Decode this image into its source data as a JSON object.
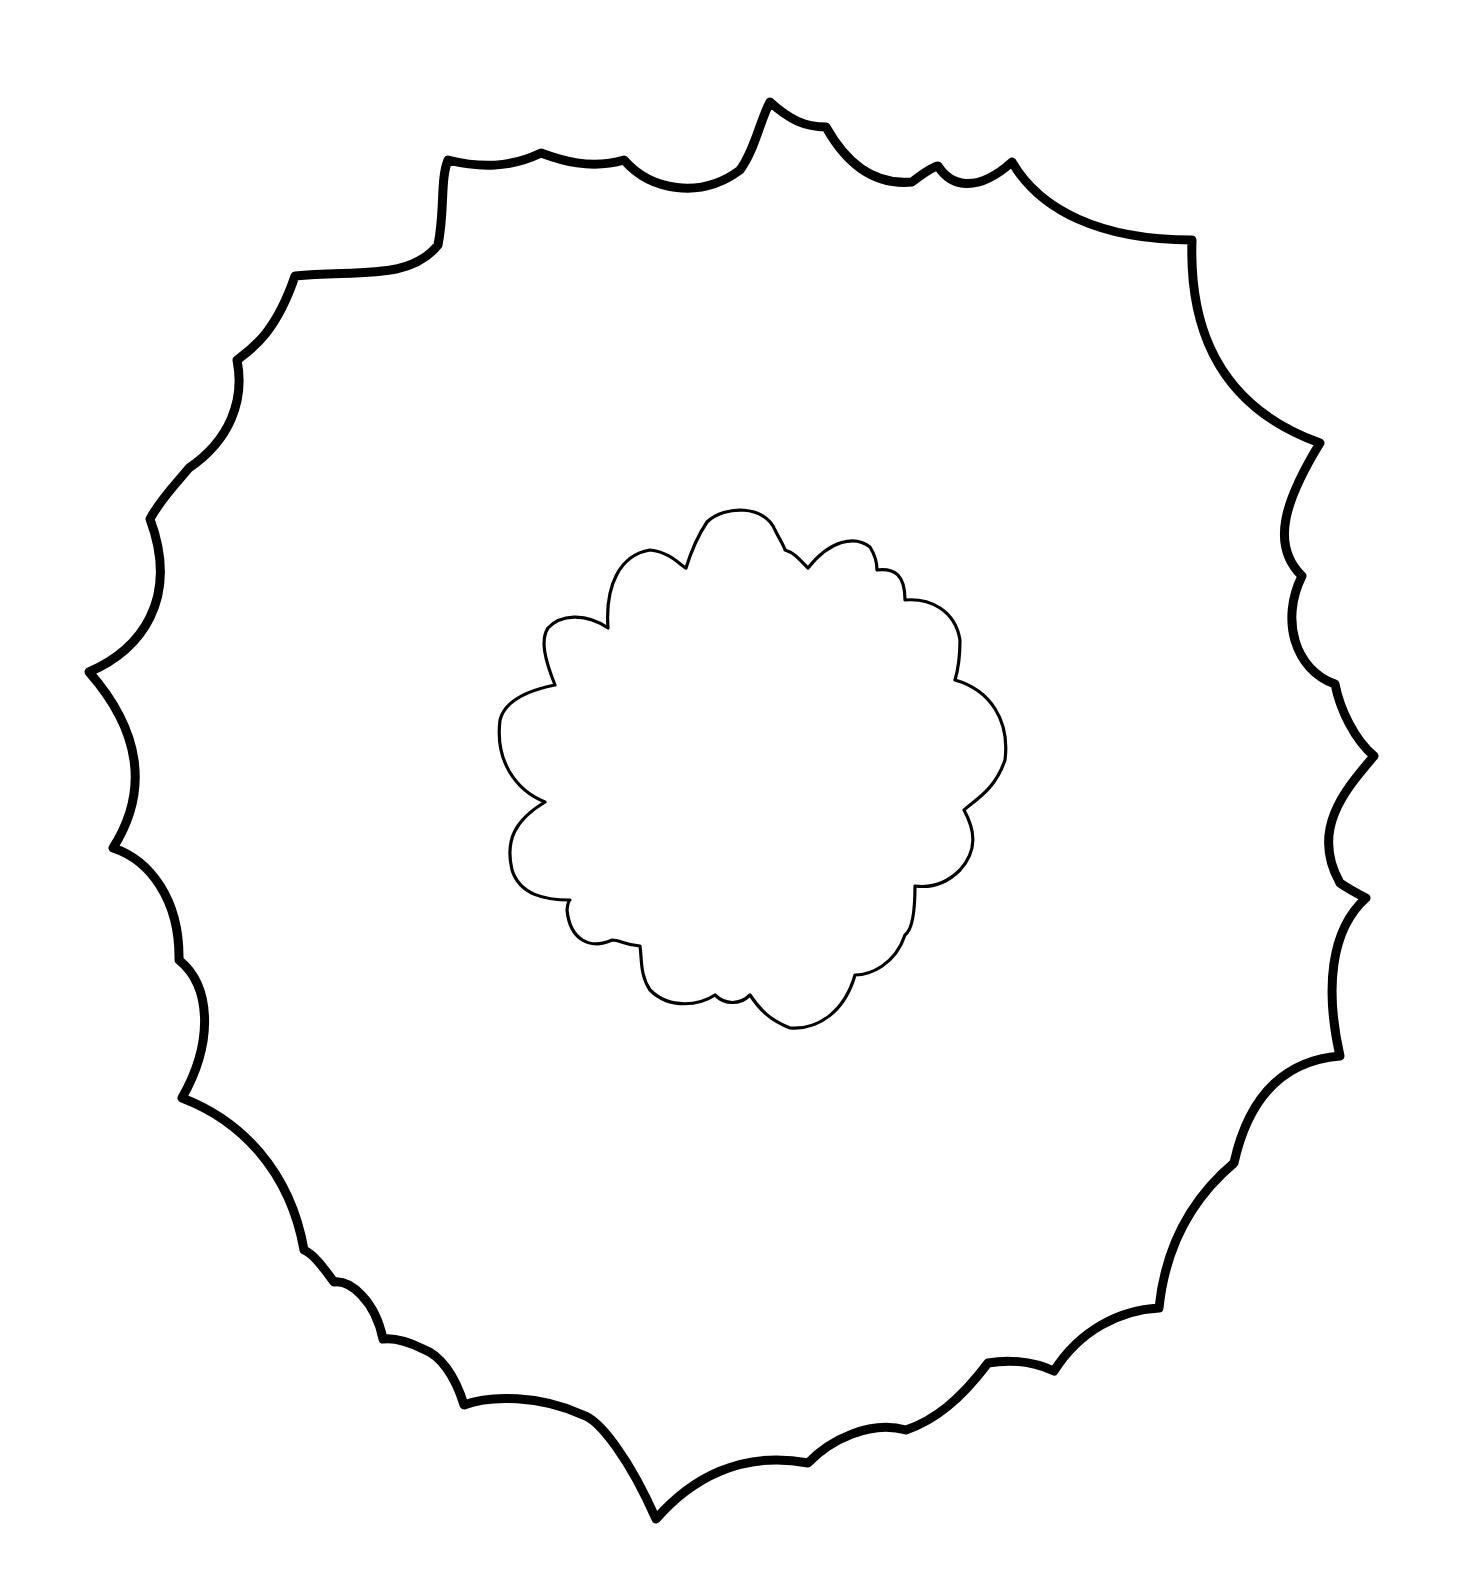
{
  "drawing": {
    "subject": "wreath-outline-template",
    "background": "#ffffff",
    "stroke_color": "#000000",
    "outer_ring": {
      "stroke_width": 9,
      "vertices": [
        [
          770,
          102
        ],
        [
          826,
          127
        ],
        [
          938,
          166
        ],
        [
          1012,
          162
        ],
        [
          1192,
          240
        ],
        [
          1320,
          443
        ],
        [
          1302,
          576
        ],
        [
          1335,
          684
        ],
        [
          1374,
          756
        ],
        [
          1340,
          883
        ],
        [
          1366,
          898
        ],
        [
          1340,
          1056
        ],
        [
          1234,
          1163
        ],
        [
          1159,
          1308
        ],
        [
          1054,
          1371
        ],
        [
          988,
          1363
        ],
        [
          906,
          1430
        ],
        [
          808,
          1463
        ],
        [
          656,
          1519
        ],
        [
          583,
          1415
        ],
        [
          464,
          1405
        ],
        [
          423,
          1349
        ],
        [
          383,
          1339
        ],
        [
          334,
          1282
        ],
        [
          304,
          1250
        ],
        [
          182,
          1098
        ],
        [
          179,
          960
        ],
        [
          113,
          848
        ],
        [
          89,
          672
        ],
        [
          150,
          519
        ],
        [
          189,
          468
        ],
        [
          237,
          360
        ],
        [
          295,
          276
        ],
        [
          438,
          245
        ],
        [
          448,
          160
        ],
        [
          541,
          153
        ],
        [
          624,
          160
        ]
      ],
      "notch_points": [
        [
          688,
          190
        ],
        [
          790,
          95
        ],
        [
          878,
          158
        ],
        [
          1012,
          162
        ],
        [
          1062,
          210
        ],
        [
          1192,
          240
        ],
        [
          1252,
          320
        ],
        [
          1320,
          443
        ],
        [
          1282,
          510
        ],
        [
          1335,
          684
        ],
        [
          1360,
          700
        ],
        [
          1374,
          756
        ],
        [
          1320,
          820
        ],
        [
          1366,
          898
        ],
        [
          1345,
          960
        ],
        [
          1240,
          1160
        ],
        [
          1195,
          1250
        ],
        [
          1159,
          1308
        ],
        [
          1130,
          1320
        ],
        [
          1054,
          1371
        ],
        [
          906,
          1430
        ],
        [
          850,
          1450
        ],
        [
          656,
          1519
        ],
        [
          620,
          1460
        ],
        [
          464,
          1405
        ],
        [
          400,
          1380
        ],
        [
          304,
          1250
        ],
        [
          250,
          1190
        ],
        [
          182,
          1098
        ],
        [
          170,
          1020
        ],
        [
          113,
          848
        ],
        [
          150,
          760
        ],
        [
          89,
          672
        ],
        [
          120,
          600
        ],
        [
          150,
          519
        ],
        [
          170,
          490
        ],
        [
          237,
          360
        ],
        [
          270,
          320
        ],
        [
          295,
          276
        ],
        [
          380,
          260
        ],
        [
          448,
          160
        ],
        [
          500,
          170
        ],
        [
          541,
          153
        ],
        [
          580,
          170
        ],
        [
          624,
          160
        ]
      ]
    },
    "inner_flower": {
      "stroke_width": 3.2,
      "center": [
        750,
        770
      ],
      "bbox": {
        "x": 497,
        "y": 508,
        "width": 510,
        "height": 524
      },
      "petal_count": 12
    }
  }
}
